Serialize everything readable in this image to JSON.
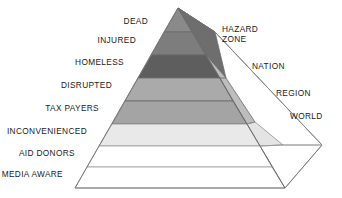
{
  "diagram": {
    "type": "pyramid-3d",
    "geometry": {
      "apex": [
        178,
        8
      ],
      "left_base": [
        75,
        188
      ],
      "front_base": [
        285,
        187
      ],
      "right_base": [
        322,
        145
      ],
      "back_apex": [
        215,
        32
      ]
    },
    "front_bands": [
      {
        "id": "dead",
        "label": "DEAD",
        "color": "#8a8a8a",
        "y_top": 8,
        "y_bottom": 32,
        "label_x": 152,
        "label_y": 21
      },
      {
        "id": "injured",
        "label": "INJURED",
        "color": "#7d7d7d",
        "y_top": 32,
        "y_bottom": 55,
        "label_x": 140,
        "label_y": 39
      },
      {
        "id": "homeless",
        "label": "HOMELESS",
        "color": "#5e5e5e",
        "y_top": 55,
        "y_bottom": 78,
        "label_x": 128,
        "label_y": 62
      },
      {
        "id": "disrupted",
        "label": "DISRUPTED",
        "color": "#aaaaaa",
        "y_top": 78,
        "y_bottom": 101,
        "label_x": 116,
        "label_y": 85
      },
      {
        "id": "tax-payers",
        "label": "TAX PAYERS",
        "color": "#a4a4a4",
        "y_top": 101,
        "y_bottom": 124,
        "label_x": 104,
        "label_y": 108
      },
      {
        "id": "inconvenienced",
        "label": "INCONVENIENCED",
        "color": "#e9e9e9",
        "y_top": 124,
        "y_bottom": 146,
        "label_x": 92,
        "label_y": 130
      },
      {
        "id": "aid-donors",
        "label": "AID DONORS",
        "color": "#ffffff",
        "y_top": 146,
        "y_bottom": 167,
        "label_x": 80,
        "label_y": 152
      },
      {
        "id": "media-aware",
        "label": "MEDIA AWARE",
        "color": "#ffffff",
        "y_top": 167,
        "y_bottom": 188,
        "label_x": 68,
        "label_y": 173
      }
    ],
    "scope_zones": [
      {
        "id": "hazard-zone",
        "label": "HAZARD\nZONE",
        "line1": "HAZARD",
        "line2": "ZONE",
        "color": "#6e6e6e",
        "label_x": 224,
        "label_y": 30
      },
      {
        "id": "nation",
        "label": "NATION",
        "color": "#bdbdbd",
        "label_x": 258,
        "label_y": 66
      },
      {
        "id": "region",
        "label": "REGION",
        "color": "#e4e4e4",
        "label_x": 281,
        "label_y": 92
      },
      {
        "id": "world",
        "label": "WORLD",
        "color": "#ffffff",
        "label_x": 294,
        "label_y": 114
      }
    ],
    "stroke_color": "#6b6b6b",
    "text_color": "#1a1a1a",
    "background": "#ffffff"
  }
}
